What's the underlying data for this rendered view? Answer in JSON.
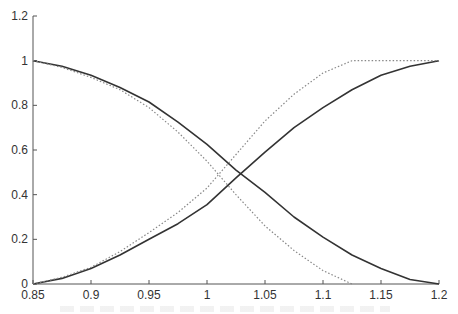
{
  "chart_data": {
    "type": "line",
    "title": "",
    "xlabel": "",
    "ylabel": "",
    "xlim": [
      0.85,
      1.2
    ],
    "ylim": [
      0,
      1.2
    ],
    "grid": false,
    "legend": null,
    "x_ticks": [
      "0.85",
      "0.9",
      "0.95",
      "1",
      "1.05",
      "1.1",
      "1.15",
      "1.2"
    ],
    "y_ticks": [
      "0",
      "0.2",
      "0.4",
      "0.6",
      "0.8",
      "1",
      "1.2"
    ],
    "series": [
      {
        "name": "solid-decreasing",
        "style": "solid",
        "x": [
          0.85,
          0.875,
          0.9,
          0.925,
          0.95,
          0.975,
          1.0,
          1.025,
          1.05,
          1.075,
          1.1,
          1.125,
          1.15,
          1.175,
          1.2
        ],
        "y": [
          1.0,
          0.975,
          0.935,
          0.88,
          0.815,
          0.725,
          0.625,
          0.51,
          0.41,
          0.3,
          0.21,
          0.13,
          0.07,
          0.02,
          0.0
        ]
      },
      {
        "name": "solid-increasing",
        "style": "solid",
        "x": [
          0.85,
          0.875,
          0.9,
          0.925,
          0.95,
          0.975,
          1.0,
          1.025,
          1.05,
          1.075,
          1.1,
          1.125,
          1.15,
          1.175,
          1.2
        ],
        "y": [
          0.0,
          0.025,
          0.07,
          0.13,
          0.2,
          0.27,
          0.355,
          0.475,
          0.59,
          0.7,
          0.79,
          0.87,
          0.935,
          0.975,
          1.0
        ]
      },
      {
        "name": "dotted-decreasing",
        "style": "dotted",
        "x": [
          0.85,
          0.875,
          0.9,
          0.925,
          0.95,
          0.975,
          1.0,
          1.025,
          1.05,
          1.075,
          1.1,
          1.125
        ],
        "y": [
          1.0,
          0.97,
          0.925,
          0.87,
          0.79,
          0.68,
          0.55,
          0.4,
          0.26,
          0.15,
          0.06,
          0.0
        ]
      },
      {
        "name": "dotted-increasing",
        "style": "dotted",
        "x": [
          0.85,
          0.875,
          0.9,
          0.925,
          0.95,
          0.975,
          1.0,
          1.025,
          1.05,
          1.075,
          1.1,
          1.125,
          1.15,
          1.175,
          1.2
        ],
        "y": [
          0.0,
          0.03,
          0.075,
          0.145,
          0.23,
          0.32,
          0.43,
          0.58,
          0.73,
          0.85,
          0.945,
          1.0,
          1.0,
          1.0,
          1.0
        ]
      }
    ]
  },
  "colors": {
    "axis": "#555555",
    "solid_line": "#333333",
    "dotted_line": "#888888",
    "tick_text": "#333333"
  }
}
